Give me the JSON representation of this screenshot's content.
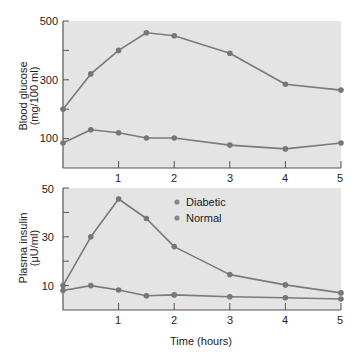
{
  "colors": {
    "plot_background": "#e4e4e4",
    "axis": "#555555",
    "line": "#7a7a7a",
    "marker": "#777777",
    "text": "#222222"
  },
  "shared_xaxis": {
    "label": "Time (hours)",
    "ticks": [
      1,
      2,
      3,
      4,
      5
    ],
    "tick_labels": [
      "1",
      "2",
      "3",
      "4",
      "5"
    ],
    "range": [
      0,
      5
    ]
  },
  "legend": {
    "items": [
      {
        "label": "Diabetic"
      },
      {
        "label": "Normal"
      }
    ]
  },
  "top_panel": {
    "ylabel_line1": "Blood glucose",
    "ylabel_line2": "(mg/100 ml)",
    "ytick_labels": [
      "500",
      "300",
      "100"
    ]
  },
  "bottom_panel": {
    "ylabel_line1": "Plasma insulin",
    "ylabel_line2": "(μU/ml)",
    "ytick_labels": [
      "50",
      "30",
      "10"
    ]
  },
  "chart_data": [
    {
      "type": "line",
      "title": "",
      "xlabel": "",
      "ylabel": "Blood glucose (mg/100 ml)",
      "x": [
        0,
        0.5,
        1,
        1.5,
        2,
        3,
        4,
        5
      ],
      "xlim": [
        0,
        5
      ],
      "xticks": [
        1,
        2,
        3,
        4,
        5
      ],
      "ylim": [
        0,
        500
      ],
      "yticks": [
        100,
        200,
        300,
        400,
        500
      ],
      "ytick_labels": [
        "100",
        "",
        "300",
        "",
        "500"
      ],
      "grid": false,
      "series": [
        {
          "name": "Diabetic",
          "values": [
            200,
            320,
            400,
            460,
            450,
            390,
            285,
            265
          ]
        },
        {
          "name": "Normal",
          "values": [
            85,
            130,
            120,
            102,
            102,
            78,
            65,
            85
          ]
        }
      ]
    },
    {
      "type": "line",
      "title": "",
      "xlabel": "Time (hours)",
      "ylabel": "Plasma insulin (μU/ml)",
      "x": [
        0,
        0.5,
        1,
        1.5,
        2,
        3,
        4,
        5
      ],
      "xlim": [
        0,
        5
      ],
      "xticks": [
        1,
        2,
        3,
        4,
        5
      ],
      "ylim": [
        0,
        50
      ],
      "yticks": [
        10,
        20,
        30,
        40,
        50
      ],
      "ytick_labels": [
        "10",
        "",
        "30",
        "",
        "50"
      ],
      "grid": false,
      "legend": {
        "position": "upper center",
        "entries": [
          "Diabetic",
          "Normal"
        ]
      },
      "series": [
        {
          "name": "Diabetic",
          "values": [
            8,
            10,
            8.2,
            5.8,
            6.2,
            5.4,
            5,
            4.5
          ]
        },
        {
          "name": "Normal",
          "values": [
            10,
            30,
            45.5,
            37.5,
            26,
            14.5,
            10.3,
            7
          ]
        }
      ]
    }
  ]
}
